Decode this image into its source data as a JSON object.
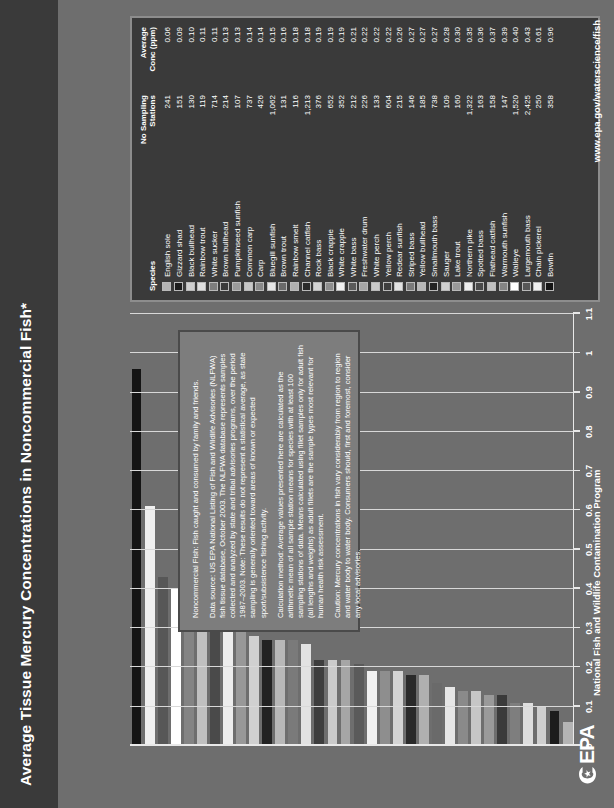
{
  "header": {
    "title": "Average Tissue Mercury Concentrations in Noncommercial Fish*"
  },
  "footer": {
    "agency_mark": "EPA",
    "program_name": "National Fish and Wildlife Contamination Program",
    "url": "www.epa.gov/waterscience/fish"
  },
  "notes": {
    "paragraphs": [
      "Noncommercial Fish:  Fish caught and consumed by family and friends.",
      "Data source: US EPA National Listing of Fish and Wildlife Advisories (NLFWA) fish tissue database, October 2003. The NLFWA database represents samples collected and analyzed by state and tribal advisories programs, over the period 1987–2003. Note: These results do not represent a statistical average, as state sampling is generally oriented toward areas of known or expected sport/subsistence fishing activity.",
      "Calculation method: Average values presented here are calculated as the arithmetic mean of all sample station means for species with at least 100 sampling stations of data. Means calculated using fillet samples only for adult fish (all lengths and weights) as adult fillets are the sample types most relevant for human health risk assessment.",
      "Caution: Mercury concentrations in fish vary considerably from region to region and water body to water body. Consumers should, first and foremost, consider any local advisories."
    ]
  },
  "legend": {
    "columns": [
      "Species",
      "No Sampling Stations",
      "Average Conc (ppm)"
    ],
    "column_species": "Species",
    "column_stations_line1": "No Sampling",
    "column_stations_line2": "Stations",
    "column_conc_line1": "Average",
    "column_conc_line2": "Conc (ppm)"
  },
  "chart_data": {
    "type": "bar",
    "orientation": "horizontal",
    "title": "Average Tissue Mercury Concentrations in Noncommercial Fish*",
    "xlabel": "Mercury concentration (ppm)",
    "ylabel": "",
    "xlim": [
      0,
      1.1
    ],
    "xticks": [
      "0",
      "0.1",
      "0.2",
      "0.3",
      "0.4",
      "0.5",
      "0.6",
      "0.7",
      "0.8",
      "0.9",
      "1",
      "1.1"
    ],
    "xtick_values": [
      0,
      0.1,
      0.2,
      0.3,
      0.4,
      0.5,
      0.6,
      0.7,
      0.8,
      0.9,
      1.0,
      1.1
    ],
    "grid": true,
    "legend_position": "right",
    "categories": [
      "English sole",
      "Gizzard shad",
      "Black bullhead",
      "Rainbow trout",
      "White sucker",
      "Brown bullhead",
      "Pumpkinseed sunfish",
      "Common carp",
      "Carp",
      "Bluegill sunfish",
      "Brown trout",
      "Rainbow smelt",
      "Channel catfish",
      "Rock bass",
      "Black crappie",
      "White crappie",
      "White bass",
      "Freshwater drum",
      "White perch",
      "Yellow perch",
      "Redear sunfish",
      "Striped bass",
      "Yellow bullhead",
      "Smallmouth bass",
      "Sauger",
      "Lake trout",
      "Northern pike",
      "Spotted bass",
      "Flathead catfish",
      "Warmouth sunfish",
      "Walleye",
      "Largemouth bass",
      "Chain pickerel",
      "Bowfin"
    ],
    "values": [
      0.06,
      0.09,
      0.1,
      0.11,
      0.11,
      0.13,
      0.13,
      0.14,
      0.14,
      0.15,
      0.16,
      0.18,
      0.18,
      0.19,
      0.19,
      0.19,
      0.21,
      0.22,
      0.22,
      0.22,
      0.26,
      0.27,
      0.27,
      0.27,
      0.28,
      0.3,
      0.35,
      0.36,
      0.37,
      0.39,
      0.4,
      0.43,
      0.61,
      0.96
    ],
    "stations": [
      "241",
      "151",
      "130",
      "119",
      "714",
      "214",
      "107",
      "737",
      "426",
      "1,062",
      "131",
      "116",
      "1,213",
      "376",
      "652",
      "352",
      "212",
      "226",
      "133",
      "604",
      "215",
      "146",
      "185",
      "738",
      "109",
      "160",
      "1,322",
      "163",
      "158",
      "147",
      "1,520",
      "2,425",
      "250",
      "358"
    ],
    "bar_colors": [
      "#b4b4b4",
      "#1c1c1c",
      "#cfcfcf",
      "#dedede",
      "#7e7e7e",
      "#3a3a3a",
      "#9a9a9a",
      "#c6c6c6",
      "#8a8a8a",
      "#e6e6e6",
      "#6a6a6a",
      "#b0b0b0",
      "#2a2a2a",
      "#d4d4d4",
      "#8e8e8e",
      "#f0f0f0",
      "#5a5a5a",
      "#a6a6a6",
      "#cacaca",
      "#3e3e3e",
      "#e2e2e2",
      "#7a7a7a",
      "#b8b8b8",
      "#222222",
      "#d0d0d0",
      "#989898",
      "#ededed",
      "#4a4a4a",
      "#c0c0c0",
      "#848484",
      "#ffffff",
      "#575757",
      "#efefef",
      "#141414"
    ]
  }
}
